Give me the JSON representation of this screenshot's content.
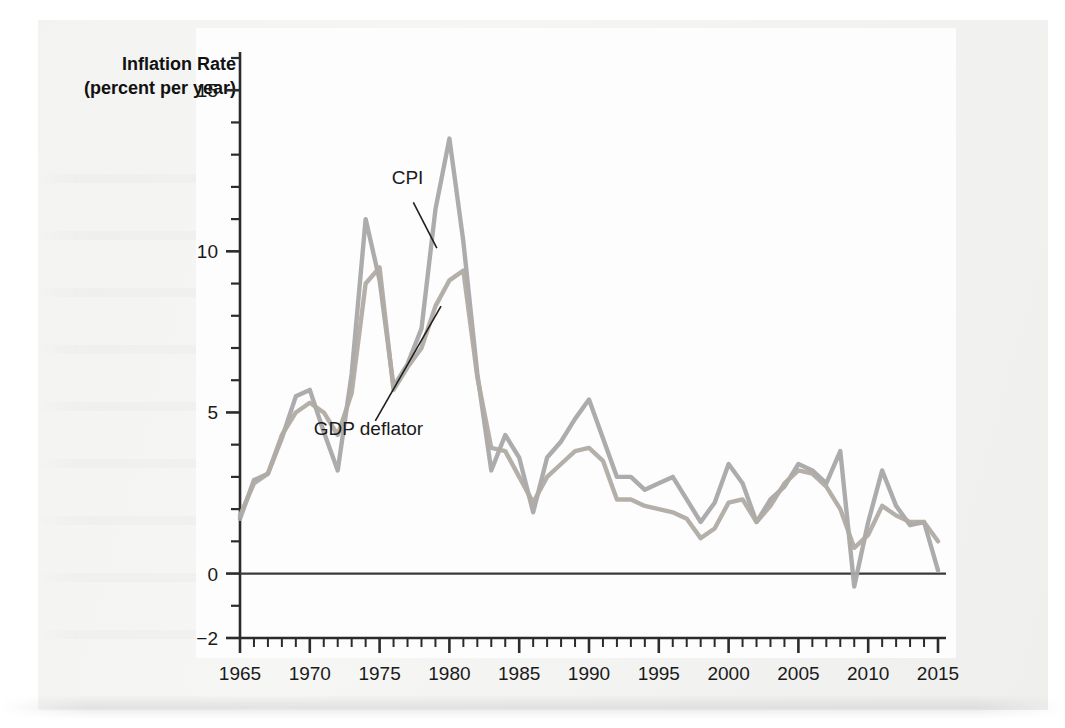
{
  "figure": {
    "media_kind": "scanned-textbook-figure"
  },
  "chart_data": {
    "type": "line",
    "title": "",
    "subtitle": "",
    "xlabel": "",
    "ylabel": "Inflation Rate",
    "ylabel_line2": "(percent per year)",
    "ylabel_units": "percent per year",
    "xlim": [
      1965,
      2015
    ],
    "ylim": [
      -2,
      16
    ],
    "grid": false,
    "legend_position": "inline-annotation",
    "y_ticks_major": [
      0,
      5,
      10,
      15
    ],
    "y_tick_labels": [
      "-2",
      "0",
      "5",
      "10",
      "15"
    ],
    "y_tick_values_labeled": [
      -2,
      0,
      5,
      10,
      15
    ],
    "y_minor_tick_step": 1,
    "x_ticks_major": [
      1965,
      1970,
      1975,
      1980,
      1985,
      1990,
      1995,
      2000,
      2005,
      2010,
      2015
    ],
    "x_tick_labels": [
      "1965",
      "1970",
      "1975",
      "1980",
      "1985",
      "1990",
      "1995",
      "2000",
      "2005",
      "2010",
      "2015"
    ],
    "x_minor_tick_step": 1,
    "zero_line": 0,
    "x": [
      1965,
      1966,
      1967,
      1968,
      1969,
      1970,
      1971,
      1972,
      1973,
      1974,
      1975,
      1976,
      1977,
      1978,
      1979,
      1980,
      1981,
      1982,
      1983,
      1984,
      1985,
      1986,
      1987,
      1988,
      1989,
      1990,
      1991,
      1992,
      1993,
      1994,
      1995,
      1996,
      1997,
      1998,
      1999,
      2000,
      2001,
      2002,
      2003,
      2004,
      2005,
      2006,
      2007,
      2008,
      2009,
      2010,
      2011,
      2012,
      2013,
      2014,
      2015
    ],
    "series": [
      {
        "name": "CPI",
        "color": "#a8a8a8",
        "annotation": "CPI",
        "values": [
          1.7,
          2.9,
          3.1,
          4.2,
          5.5,
          5.7,
          4.4,
          3.2,
          6.2,
          11.0,
          9.1,
          5.8,
          6.5,
          7.6,
          11.3,
          13.5,
          10.3,
          6.2,
          3.2,
          4.3,
          3.6,
          1.9,
          3.6,
          4.1,
          4.8,
          5.4,
          4.2,
          3.0,
          3.0,
          2.6,
          2.8,
          3.0,
          2.3,
          1.6,
          2.2,
          3.4,
          2.8,
          1.6,
          2.3,
          2.7,
          3.4,
          3.2,
          2.8,
          3.8,
          -0.4,
          1.6,
          3.2,
          2.1,
          1.5,
          1.6,
          0.1
        ]
      },
      {
        "name": "GDP deflator",
        "color": "#b0aca4",
        "annotation": "GDP deflator",
        "values": [
          1.8,
          2.8,
          3.1,
          4.3,
          5.0,
          5.3,
          5.0,
          4.3,
          5.6,
          9.0,
          9.5,
          5.7,
          6.4,
          7.0,
          8.3,
          9.1,
          9.4,
          6.1,
          3.9,
          3.8,
          3.0,
          2.2,
          3.0,
          3.4,
          3.8,
          3.9,
          3.5,
          2.3,
          2.3,
          2.1,
          2.0,
          1.9,
          1.7,
          1.1,
          1.4,
          2.2,
          2.3,
          1.6,
          2.1,
          2.8,
          3.2,
          3.1,
          2.7,
          2.0,
          0.8,
          1.2,
          2.1,
          1.8,
          1.6,
          1.6,
          1.0
        ]
      }
    ],
    "annotations": [
      {
        "label": "CPI",
        "x_text": 1977.0,
        "y_text": 12.1,
        "leader_to_x": 1979.1,
        "leader_to_y": 10.1
      },
      {
        "label": "GDP deflator",
        "x_text": 1974.2,
        "y_text": 4.3,
        "leader_to_x": 1979.4,
        "leader_to_y": 8.3
      }
    ],
    "colors": {
      "cpi": "#a8a8a8",
      "gdp_deflator": "#b0aca4",
      "axis": "#2b2b2b",
      "zero_line": "#3a3a3a",
      "text": "#1a1a1a",
      "page_background": "#f3f3f1",
      "plot_background": "#fdfdfd"
    }
  }
}
